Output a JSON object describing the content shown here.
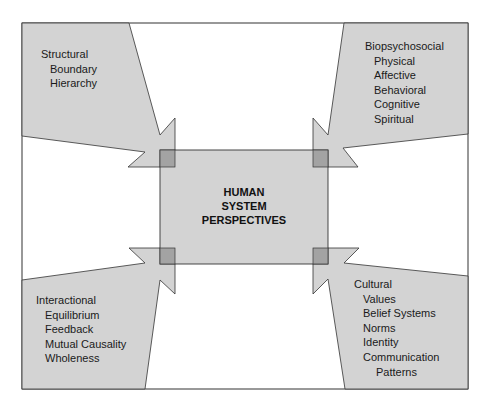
{
  "diagram": {
    "type": "concept-diagram",
    "colors": {
      "background": "#ffffff",
      "frame_stroke": "#333333",
      "shape_fill": "#d3d3d3",
      "overlap_fill": "#a3a3a3",
      "text": "#1a1a1a"
    },
    "center": {
      "lines": [
        "HUMAN",
        "SYSTEM",
        "PERSPECTIVES"
      ]
    },
    "quadrants": {
      "top_left": {
        "heading": "Structural",
        "items": [
          "Boundary",
          "Hierarchy"
        ]
      },
      "top_right": {
        "heading": "Biopsychosocial",
        "items": [
          "Physical",
          "Affective",
          "Behavioral",
          "Cognitive",
          "Spiritual"
        ]
      },
      "bottom_left": {
        "heading": "Interactional",
        "items": [
          "Equilibrium",
          "Feedback",
          "Mutual Causality",
          "Wholeness"
        ]
      },
      "bottom_right": {
        "heading": "Cultural",
        "items": [
          "Values",
          "Belief Systems",
          "Norms",
          "Identity",
          "Communication"
        ],
        "continuation": "Patterns"
      }
    }
  }
}
